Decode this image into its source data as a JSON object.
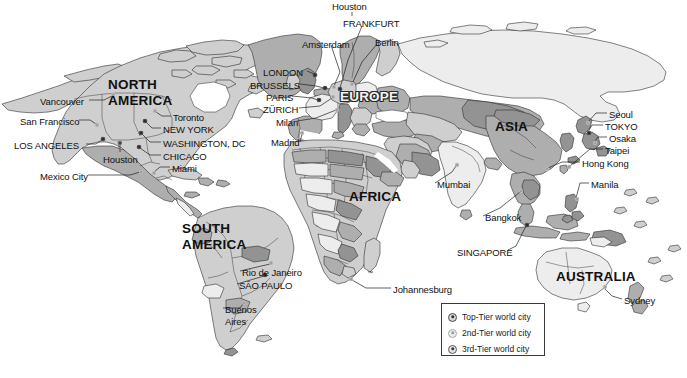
{
  "map": {
    "title": "World city hierarchy map",
    "continents": [
      {
        "name": "NORTH AMERICA",
        "line1": "NORTH",
        "line2": "AMERICA",
        "x": 108,
        "y": 78,
        "style": "dark"
      },
      {
        "name": "SOUTH AMERICA",
        "line1": "SOUTH",
        "line2": "AMERICA",
        "x": 182,
        "y": 222,
        "style": "dark"
      },
      {
        "name": "EUROPE",
        "line1": "EUROPE",
        "line2": "",
        "x": 340,
        "y": 90,
        "style": "outline"
      },
      {
        "name": "AFRICA",
        "line1": "AFRICA",
        "line2": "",
        "x": 349,
        "y": 190,
        "style": "dark"
      },
      {
        "name": "ASIA",
        "line1": "ASIA",
        "line2": "",
        "x": 495,
        "y": 120,
        "style": "dark"
      },
      {
        "name": "AUSTRALIA",
        "line1": "AUSTRALIA",
        "line2": "",
        "x": 556,
        "y": 270,
        "style": "dark"
      }
    ],
    "cities": [
      {
        "label": "Houston",
        "x": 332,
        "y": 2,
        "align": "left",
        "tier": "floating"
      },
      {
        "label": "FRANKFURT",
        "x": 343,
        "y": 19,
        "align": "left",
        "tier": "top"
      },
      {
        "label": "Amsterdam",
        "x": 302,
        "y": 40,
        "align": "left",
        "tier": "2nd"
      },
      {
        "label": "Berlin",
        "x": 375,
        "y": 38,
        "align": "left",
        "tier": "2nd"
      },
      {
        "label": "LONDON",
        "x": 263,
        "y": 68,
        "align": "left",
        "tier": "top"
      },
      {
        "label": "BRUSSELS",
        "x": 250,
        "y": 81,
        "align": "left",
        "tier": "top"
      },
      {
        "label": "PARIS",
        "x": 266,
        "y": 93,
        "align": "left",
        "tier": "top"
      },
      {
        "label": "ZÜRICH",
        "x": 263,
        "y": 105,
        "align": "left",
        "tier": "2nd"
      },
      {
        "label": "Milan",
        "x": 276,
        "y": 118,
        "align": "left",
        "tier": "2nd"
      },
      {
        "label": "Madrid",
        "x": 271,
        "y": 138,
        "align": "left",
        "tier": "2nd"
      },
      {
        "label": "Vancouver",
        "x": 40,
        "y": 97,
        "align": "left",
        "tier": "2nd"
      },
      {
        "label": "San Francisco",
        "x": 20,
        "y": 117,
        "align": "left",
        "tier": "2nd"
      },
      {
        "label": "LOS ANGELES",
        "x": 14,
        "y": 141,
        "align": "left",
        "tier": "top"
      },
      {
        "label": "Mexico City",
        "x": 40,
        "y": 172,
        "align": "left",
        "tier": "2nd"
      },
      {
        "label": "Houston",
        "x": 103,
        "y": 155,
        "align": "left",
        "tier": "3rd"
      },
      {
        "label": "Toronto",
        "x": 173,
        "y": 113,
        "align": "left",
        "tier": "2nd"
      },
      {
        "label": "NEW YORK",
        "x": 163,
        "y": 125,
        "align": "left",
        "tier": "top"
      },
      {
        "label": "WASHINGTON, DC",
        "x": 163,
        "y": 139,
        "align": "left",
        "tier": "top"
      },
      {
        "label": "CHICAGO",
        "x": 163,
        "y": 152,
        "align": "left",
        "tier": "top"
      },
      {
        "label": "Miami",
        "x": 172,
        "y": 164,
        "align": "left",
        "tier": "2nd"
      },
      {
        "label": "Rio de Janeiro",
        "x": 242,
        "y": 268,
        "align": "left",
        "tier": "2nd"
      },
      {
        "label": "SÃO PAULO",
        "x": 239,
        "y": 281,
        "align": "left",
        "tier": "top"
      },
      {
        "label": "Buenos",
        "x": 225,
        "y": 305,
        "align": "left",
        "tier": "2nd"
      },
      {
        "label": "Aires",
        "x": 225,
        "y": 317,
        "align": "left",
        "tier": "2nd"
      },
      {
        "label": "Mumbai",
        "x": 437,
        "y": 180,
        "align": "left",
        "tier": "2nd"
      },
      {
        "label": "Johannesburg",
        "x": 393,
        "y": 285,
        "align": "left",
        "tier": "2nd"
      },
      {
        "label": "Bangkok",
        "x": 485,
        "y": 213,
        "align": "left",
        "tier": "2nd"
      },
      {
        "label": "SINGAPORE",
        "x": 457,
        "y": 248,
        "align": "left",
        "tier": "top"
      },
      {
        "label": "Seoul",
        "x": 609,
        "y": 110,
        "align": "left",
        "tier": "2nd"
      },
      {
        "label": "TOKYO",
        "x": 605,
        "y": 122,
        "align": "left",
        "tier": "top"
      },
      {
        "label": "Osaka",
        "x": 609,
        "y": 134,
        "align": "left",
        "tier": "2nd"
      },
      {
        "label": "Taipei",
        "x": 605,
        "y": 146,
        "align": "left",
        "tier": "2nd"
      },
      {
        "label": "Hong Kong",
        "x": 582,
        "y": 159,
        "align": "left",
        "tier": "2nd"
      },
      {
        "label": "Manila",
        "x": 591,
        "y": 180,
        "align": "left",
        "tier": "2nd"
      },
      {
        "label": "Sydney",
        "x": 624,
        "y": 296,
        "align": "left",
        "tier": "2nd"
      }
    ],
    "trademark": {
      "label": "™",
      "x": 367,
      "y": 270
    }
  },
  "legend": {
    "items": [
      {
        "label": "Top-Tier world city",
        "tier": "top"
      },
      {
        "label": "2nd-Tier world city",
        "tier": "2nd"
      },
      {
        "label": "3rd-Tier world city",
        "tier": "3rd"
      }
    ]
  },
  "colors": {
    "land_light": "#ededed",
    "land_mid": "#cfcfcf",
    "land_dark": "#a9a9a9",
    "land_darker": "#8f8f8f",
    "ocean": "#ffffff",
    "outline": "#2f2f2f",
    "text": "#111111"
  }
}
